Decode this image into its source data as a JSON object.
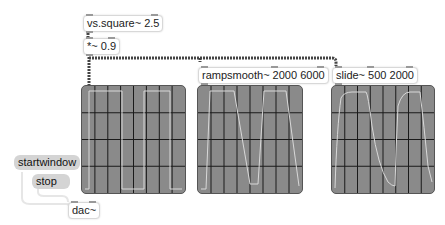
{
  "objects": {
    "vs_square": {
      "label": "vs.square~ 2.5"
    },
    "mult": {
      "label": "*~ 0.9"
    },
    "rampsmooth": {
      "label": "rampsmooth~ 2000 6000"
    },
    "slide": {
      "label": "slide~ 500 2000"
    },
    "dac": {
      "label": "dac~"
    }
  },
  "messages": {
    "startwindow": {
      "label": "startwindow"
    },
    "stop": {
      "label": "stop"
    }
  },
  "scopes": [
    {
      "name": "scope-raw",
      "grid_cols": 8,
      "grid_rows": 4,
      "waveform": "square"
    },
    {
      "name": "scope-rampsmooth",
      "grid_cols": 8,
      "grid_rows": 4,
      "waveform": "linear-ramped square"
    },
    {
      "name": "scope-slide",
      "grid_cols": 8,
      "grid_rows": 4,
      "waveform": "exponentially slid square"
    }
  ],
  "colors": {
    "scope_bg": "#8a8a8a",
    "grid": "#1a1a1a",
    "trace": "#d8d8d8",
    "message_bg": "#d4d4d4",
    "signal_wire": "#555555"
  }
}
